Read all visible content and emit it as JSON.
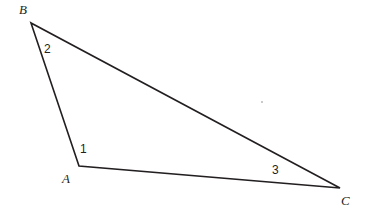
{
  "figure": {
    "type": "geometry-diagram",
    "shape": "triangle",
    "background_color": "#ffffff",
    "stroke_color": "#231f20",
    "stroke_width": 1.6,
    "canvas": {
      "width": 370,
      "height": 215
    },
    "vertices": [
      {
        "id": "B",
        "label": "B",
        "x": 31,
        "y": 23,
        "label_x": 19,
        "label_y": 3
      },
      {
        "id": "A",
        "label": "A",
        "x": 79,
        "y": 166,
        "label_x": 62,
        "label_y": 172
      },
      {
        "id": "C",
        "label": "C",
        "x": 340,
        "y": 188,
        "label_x": 341,
        "label_y": 194
      }
    ],
    "edges": [
      {
        "id": "AB",
        "from": "B",
        "to": "A"
      },
      {
        "id": "BC",
        "from": "B",
        "to": "C"
      },
      {
        "id": "AC",
        "from": "A",
        "to": "C"
      }
    ],
    "angle_labels": [
      {
        "id": "angle-1",
        "label": "1",
        "at_vertex": "A",
        "x": 80,
        "y": 143
      },
      {
        "id": "angle-2",
        "label": "2",
        "at_vertex": "B",
        "x": 44,
        "y": 43
      },
      {
        "id": "angle-3",
        "label": "3",
        "at_vertex": "C",
        "x": 272,
        "y": 164
      }
    ],
    "marks": [
      {
        "id": "speck",
        "kind": "dot-artifact",
        "x": 261,
        "y": 101,
        "color": "#b8b8b8"
      }
    ],
    "polygon_points": "31,23 79,166 340,188"
  }
}
